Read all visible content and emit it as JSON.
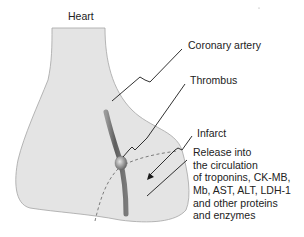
{
  "diagram": {
    "labels": {
      "heart": "Heart",
      "coronary_artery": "Coronary artery",
      "thrombus": "Thrombus",
      "infarct": "Infarct",
      "release_lines": [
        "Release into",
        "the circulation",
        "of troponins, CK-MB,",
        "Mb, AST, ALT, LDH-1",
        "and other proteins",
        "and enzymes"
      ]
    },
    "colors": {
      "heart_fill": "#e4e4e4",
      "heart_outline": "#9a9a9a",
      "artery": "#6e6e6e",
      "thrombus": "#8a8a8a",
      "leader_line": "#1a1a1a",
      "infarct_border": "#777777"
    }
  }
}
